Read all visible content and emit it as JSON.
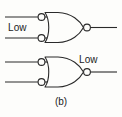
{
  "figure": {
    "caption": "(b)",
    "background_color": "#fdfdfb",
    "line_color": "#2a2a2a"
  },
  "annotations": [
    {
      "id": "low-1",
      "text": "Low",
      "attached_to": "gate-1-inputs"
    },
    {
      "id": "low-2",
      "text": "Low",
      "attached_to": "gate-2-output"
    }
  ],
  "circuit": {
    "type": "logic-gate-diagram",
    "gates": [
      {
        "id": "gate-1",
        "symbol": "negative-OR",
        "shape": "or-gate",
        "input_bubbles": 2,
        "output_bubble": true,
        "inputs": 2,
        "input_label": "Low",
        "output_label": ""
      },
      {
        "id": "gate-2",
        "symbol": "negative-OR",
        "shape": "or-gate",
        "input_bubbles": 2,
        "output_bubble": true,
        "inputs": 2,
        "input_label": "",
        "output_label": "Low"
      }
    ]
  }
}
